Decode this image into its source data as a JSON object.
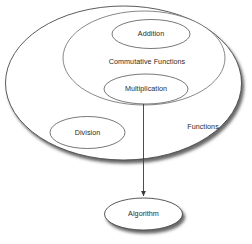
{
  "diagram": {
    "type": "nested-set-venn-diagram",
    "background_color": "#ffffff",
    "stroke_color": "#4a4a4a",
    "text_color": "#2b2b2b",
    "shadow_color": "#4d4d4d",
    "nodes": [
      {
        "id": "functions",
        "label": "Functions",
        "shape": "ellipse",
        "role": "outer-set",
        "cx": 123.5,
        "cy": 83,
        "rx": 118,
        "ry": 77,
        "label_x": 203,
        "label_y": 127,
        "has_shadow": true
      },
      {
        "id": "commutative-functions",
        "label": "Commutative Functions",
        "shape": "ellipse",
        "role": "inner-set",
        "cx": 144,
        "cy": 58,
        "rx": 81,
        "ry": 47,
        "label_x": 147,
        "label_y": 62,
        "has_shadow": false
      },
      {
        "id": "addition",
        "label": "Addition",
        "shape": "ellipse",
        "role": "member",
        "cx": 151,
        "cy": 34,
        "rx": 39,
        "ry": 14.5,
        "label_x": 151,
        "label_y": 34,
        "has_shadow": false
      },
      {
        "id": "multiplication",
        "label": "Multiplication",
        "shape": "ellipse",
        "role": "member",
        "cx": 146,
        "cy": 89,
        "rx": 42,
        "ry": 15,
        "label_x": 146,
        "label_y": 89,
        "has_shadow": false
      },
      {
        "id": "division",
        "label": "Division",
        "shape": "ellipse",
        "role": "member",
        "cx": 87.5,
        "cy": 132.5,
        "rx": 37.5,
        "ry": 16,
        "label_x": 87.5,
        "label_y": 132.5,
        "has_shadow": false
      },
      {
        "id": "algorithm",
        "label": "Algorithm",
        "shape": "ellipse",
        "role": "target",
        "cx": 143.5,
        "cy": 214,
        "rx": 39,
        "ry": 16,
        "label_x": 143.5,
        "label_y": 214,
        "has_shadow": true
      }
    ],
    "connectors": [
      {
        "id": "multiplication-to-algorithm",
        "from": "multiplication",
        "to": "algorithm",
        "x1": 143.5,
        "y1": 104,
        "x2": 143.5,
        "y2": 197,
        "arrowhead": "end"
      }
    ]
  }
}
